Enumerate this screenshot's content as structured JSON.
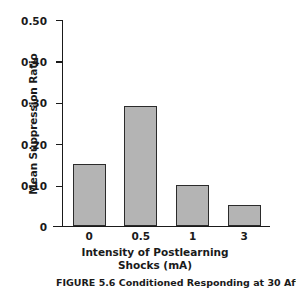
{
  "chart_data": {
    "type": "bar",
    "title": "",
    "categories": [
      "0",
      "0.5",
      "1",
      "3"
    ],
    "values": [
      0.15,
      0.29,
      0.1,
      0.05
    ],
    "series": [
      {
        "name": "Mean Suppression Ratio",
        "values": [
          0.15,
          0.29,
          0.1,
          0.05
        ]
      }
    ],
    "xlabel": "Intensity of Postlearning Shocks (mA)",
    "xlabel_line1": "Intensity of Postlearning",
    "xlabel_line2": "Shocks (mA)",
    "ylabel": "Mean Suppression Ratio",
    "ylim": [
      0,
      0.5
    ],
    "yticks": [
      0.5,
      0.4,
      0.3,
      0.2,
      0.1,
      0
    ],
    "ytick_labels": [
      "0.50",
      "0.40",
      "0.30",
      "0.20",
      "0.10",
      "0"
    ],
    "grid": false,
    "legend": false,
    "bar_fill_color": "#b4b4b4",
    "bar_edge_color": "#2b2b2b",
    "axis_color": "#1a1a1a"
  },
  "caption": {
    "lead": "FIGURE 5.6",
    "rest": "Conditioned Responding at  30 Aft"
  }
}
